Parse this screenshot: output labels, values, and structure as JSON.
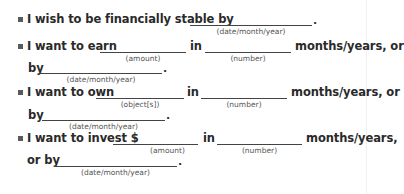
{
  "items": [
    {
      "lines": [
        {
          "prefix": "I wish to be financially stable by",
          "blank_hint": "(date/month/year)",
          "suffix": "."
        }
      ]
    },
    {
      "lines": [
        {
          "prefix": "I want to earn",
          "blank1_hint": "(amount)",
          "connector": "in",
          "blank2_hint": "(number)",
          "suffix": "months/years, or"
        },
        {
          "prefix": "by",
          "blank_hint": "(date/month/year)",
          "suffix": "."
        }
      ]
    },
    {
      "lines": [
        {
          "prefix": "I want to own",
          "blank1_hint": "(object[s])",
          "connector": "in",
          "blank2_hint": "(number)",
          "suffix": "months/years, or"
        },
        {
          "prefix": "by",
          "blank_hint": "(date/month/year)",
          "suffix": "."
        }
      ]
    },
    {
      "lines": [
        {
          "prefix": "I want to invest $",
          "blank1_hint": "(amount)",
          "connector": "in",
          "blank2_hint": "(number)",
          "suffix": "months/years,"
        },
        {
          "prefix": "or by",
          "blank_hint": "(date/month/year)",
          "suffix": "."
        }
      ]
    }
  ]
}
